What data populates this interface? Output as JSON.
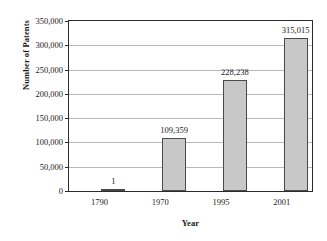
{
  "chart_data": {
    "type": "bar",
    "title": "",
    "xlabel": "Year",
    "ylabel": "Number of Patents",
    "categories": [
      "1790",
      "1970",
      "1995",
      "2001"
    ],
    "values": [
      1,
      109359,
      228238,
      315015
    ],
    "value_labels": [
      "1",
      "109,359",
      "228,238",
      "315,015"
    ],
    "ylim": [
      0,
      350000
    ],
    "ytick_values": [
      0,
      50000,
      100000,
      150000,
      200000,
      250000,
      300000,
      350000
    ],
    "ytick_labels": [
      "0",
      "50,000",
      "100,000",
      "150,000",
      "200,000",
      "250,000",
      "300,000",
      "350,000"
    ],
    "grid": true,
    "legend": false,
    "legend_position": "none",
    "bar_fill_color": "#c8c8c8",
    "bar_border_color": "#4a4a4a",
    "gridline_color": "#b9b9b9",
    "frame_color": "#2b2b2b"
  }
}
